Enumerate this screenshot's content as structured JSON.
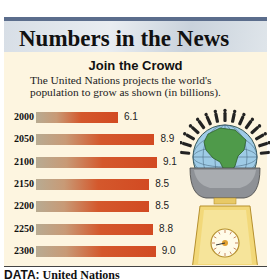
{
  "header": {
    "title": "Numbers in the News"
  },
  "chart_data": {
    "type": "bar",
    "orientation": "horizontal",
    "title": "Join the Crowd",
    "subtitle": "The United Nations projects the world's population to grow as shown (in billions).",
    "categories": [
      "2000",
      "2050",
      "2100",
      "2150",
      "2200",
      "2250",
      "2300"
    ],
    "values": [
      6.1,
      8.9,
      9.1,
      8.5,
      8.5,
      8.8,
      9.0
    ],
    "value_labels": [
      "6.1",
      "8.9",
      "9.1",
      "8.5",
      "8.5",
      "8.8",
      "9.0"
    ],
    "xlabel": "",
    "ylabel": "",
    "units": "billions",
    "grid": false,
    "legend": null,
    "bar_color": "#d24a22"
  },
  "footer": {
    "label": "DATA:",
    "source": "United Nations"
  },
  "illustration": {
    "description": "globe-with-people-on-scale"
  },
  "colors": {
    "panel_bg": "#fdf5e0",
    "top_bar": "#5b6d8c",
    "bar_end": "#d24a22",
    "bar_start": "#b8ab92"
  }
}
